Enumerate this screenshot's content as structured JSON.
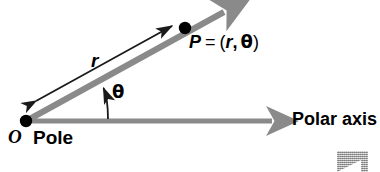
{
  "figure": {
    "type": "polar-coordinate-diagram",
    "width": 380,
    "height": 172,
    "background": "#ffffff"
  },
  "colors": {
    "ray": "#8a8a8a",
    "axis": "#8a8a8a",
    "measure_arrow": "#1a1a1a",
    "point_dot": "#000000",
    "text": "#000000",
    "watermark": "#a8a8a8"
  },
  "labels": {
    "origin": "O",
    "pole": "Pole",
    "radius": "r",
    "angle": "θ",
    "polar_axis": "Polar axis"
  },
  "point_label": {
    "name": "P",
    "equals": "=",
    "open_paren": "(",
    "radius": "r",
    "comma": ",",
    "angle": "θ",
    "close_paren": ")"
  },
  "geometry": {
    "origin": {
      "x": 26,
      "y": 121
    },
    "point_p": {
      "x": 185,
      "y": 28,
      "radius": 6
    },
    "ray_tip": {
      "x": 236,
      "y": 5
    },
    "axis_tip": {
      "x": 284,
      "y": 121
    },
    "ray_thickness": 6,
    "axis_thickness": 5,
    "measure_arrow_start": {
      "x": 28,
      "y": 107
    },
    "measure_arrow_end": {
      "x": 180,
      "y": 20
    },
    "angle_arc_start": {
      "x": 108,
      "y": 119
    },
    "angle_arc_end": {
      "x": 103,
      "y": 82
    }
  }
}
